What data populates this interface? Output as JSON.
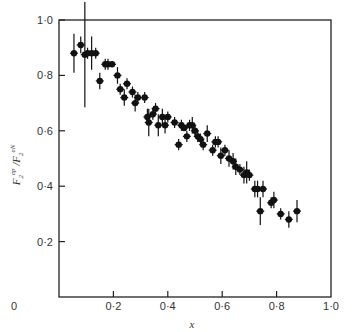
{
  "chart_data": {
    "type": "scatter",
    "title": "",
    "xlabel": "x",
    "ylabel": "F2^ep / F2^eN",
    "xlim": [
      0,
      1.0
    ],
    "ylim": [
      0,
      1.0
    ],
    "grid": false,
    "legend": null,
    "x_ticks": [
      "0",
      "0·2",
      "0·4",
      "0·6",
      "0·8",
      "1·0"
    ],
    "y_ticks": [
      "0·2",
      "0·4",
      "0·6",
      "0·8",
      "1·0"
    ],
    "series": [
      {
        "name": "data",
        "points": [
          {
            "x": 0.055,
            "y": 0.88,
            "err": 0.07
          },
          {
            "x": 0.08,
            "y": 0.91,
            "err": 0.03
          },
          {
            "x": 0.095,
            "y": 0.875,
            "err": 0.19
          },
          {
            "x": 0.105,
            "y": 0.88,
            "err": 0.02
          },
          {
            "x": 0.12,
            "y": 0.88,
            "err": 0.06
          },
          {
            "x": 0.135,
            "y": 0.88,
            "err": 0.02
          },
          {
            "x": 0.15,
            "y": 0.78,
            "err": 0.03
          },
          {
            "x": 0.17,
            "y": 0.84,
            "err": 0.02
          },
          {
            "x": 0.18,
            "y": 0.84,
            "err": 0.02
          },
          {
            "x": 0.195,
            "y": 0.84,
            "err": 0.01
          },
          {
            "x": 0.215,
            "y": 0.8,
            "err": 0.03
          },
          {
            "x": 0.225,
            "y": 0.75,
            "err": 0.02
          },
          {
            "x": 0.24,
            "y": 0.72,
            "err": 0.03
          },
          {
            "x": 0.25,
            "y": 0.77,
            "err": 0.02
          },
          {
            "x": 0.27,
            "y": 0.74,
            "err": 0.02
          },
          {
            "x": 0.28,
            "y": 0.7,
            "err": 0.03
          },
          {
            "x": 0.29,
            "y": 0.72,
            "err": 0.02
          },
          {
            "x": 0.315,
            "y": 0.72,
            "err": 0.02
          },
          {
            "x": 0.325,
            "y": 0.65,
            "err": 0.03
          },
          {
            "x": 0.33,
            "y": 0.63,
            "err": 0.05
          },
          {
            "x": 0.345,
            "y": 0.66,
            "err": 0.02
          },
          {
            "x": 0.355,
            "y": 0.68,
            "err": 0.02
          },
          {
            "x": 0.365,
            "y": 0.62,
            "err": 0.04
          },
          {
            "x": 0.38,
            "y": 0.65,
            "err": 0.03
          },
          {
            "x": 0.39,
            "y": 0.62,
            "err": 0.03
          },
          {
            "x": 0.4,
            "y": 0.65,
            "err": 0.02
          },
          {
            "x": 0.425,
            "y": 0.63,
            "err": 0.02
          },
          {
            "x": 0.44,
            "y": 0.55,
            "err": 0.02
          },
          {
            "x": 0.45,
            "y": 0.62,
            "err": 0.02
          },
          {
            "x": 0.46,
            "y": 0.61,
            "err": 0.01
          },
          {
            "x": 0.47,
            "y": 0.58,
            "err": 0.02
          },
          {
            "x": 0.48,
            "y": 0.62,
            "err": 0.02
          },
          {
            "x": 0.49,
            "y": 0.62,
            "err": 0.03
          },
          {
            "x": 0.5,
            "y": 0.6,
            "err": 0.02
          },
          {
            "x": 0.51,
            "y": 0.58,
            "err": 0.02
          },
          {
            "x": 0.52,
            "y": 0.57,
            "err": 0.02
          },
          {
            "x": 0.53,
            "y": 0.55,
            "err": 0.02
          },
          {
            "x": 0.545,
            "y": 0.59,
            "err": 0.03
          },
          {
            "x": 0.565,
            "y": 0.53,
            "err": 0.02
          },
          {
            "x": 0.575,
            "y": 0.56,
            "err": 0.02
          },
          {
            "x": 0.585,
            "y": 0.56,
            "err": 0.02
          },
          {
            "x": 0.595,
            "y": 0.51,
            "err": 0.03
          },
          {
            "x": 0.61,
            "y": 0.53,
            "err": 0.02
          },
          {
            "x": 0.625,
            "y": 0.5,
            "err": 0.03
          },
          {
            "x": 0.64,
            "y": 0.49,
            "err": 0.03
          },
          {
            "x": 0.65,
            "y": 0.47,
            "err": 0.03
          },
          {
            "x": 0.665,
            "y": 0.46,
            "err": 0.02
          },
          {
            "x": 0.68,
            "y": 0.44,
            "err": 0.03
          },
          {
            "x": 0.69,
            "y": 0.45,
            "err": 0.04
          },
          {
            "x": 0.7,
            "y": 0.44,
            "err": 0.02
          },
          {
            "x": 0.72,
            "y": 0.39,
            "err": 0.03
          },
          {
            "x": 0.73,
            "y": 0.39,
            "err": 0.03
          },
          {
            "x": 0.74,
            "y": 0.31,
            "err": 0.05
          },
          {
            "x": 0.75,
            "y": 0.39,
            "err": 0.03
          },
          {
            "x": 0.78,
            "y": 0.34,
            "err": 0.02
          },
          {
            "x": 0.79,
            "y": 0.35,
            "err": 0.03
          },
          {
            "x": 0.815,
            "y": 0.3,
            "err": 0.02
          },
          {
            "x": 0.845,
            "y": 0.28,
            "err": 0.03
          },
          {
            "x": 0.875,
            "y": 0.31,
            "err": 0.04
          }
        ]
      }
    ]
  }
}
